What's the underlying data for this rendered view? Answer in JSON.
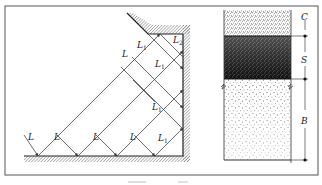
{
  "figure": {
    "left_panel": {
      "description": "Wave rays reflecting between a hatched floor and a hatched vertical wall with a sloped upper corner",
      "incident_labels": [
        "L",
        "L",
        "L",
        "L",
        "L",
        "L"
      ],
      "reflected_labels": [
        "L1",
        "L1",
        "L1",
        "L1",
        "L1"
      ],
      "secondary_label": "L2",
      "label_base": "L",
      "subscript_1": "1",
      "subscript_2": "2"
    },
    "right_panel": {
      "description": "Layered column with dimension line",
      "layers": [
        {
          "label": "C",
          "shade": "light-dense"
        },
        {
          "label": "S",
          "shade": "dark"
        },
        {
          "label": "B",
          "shade": "sparse"
        }
      ]
    },
    "colors": {
      "line": "#333333",
      "frame": "#555555",
      "hatch": "#777777",
      "dark_layer": "#111111"
    }
  }
}
